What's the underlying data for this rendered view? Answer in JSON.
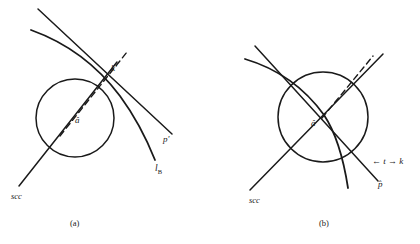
{
  "figure": {
    "panels": [
      {
        "caption": "(a)",
        "labels": {
          "tangent_point": "kʹ",
          "center": "â",
          "scc_line": "scc",
          "p_line": "pʹ",
          "lb_curve": "l",
          "lb_curve_sub": "B"
        }
      },
      {
        "caption": "(b)",
        "labels": {
          "center": "â",
          "scc_line": "scc",
          "tk_annotation": "← t → k",
          "p_curve": "p̂"
        }
      }
    ]
  },
  "style": {
    "stroke": "#1a1a1a",
    "background": "#ffffff"
  }
}
